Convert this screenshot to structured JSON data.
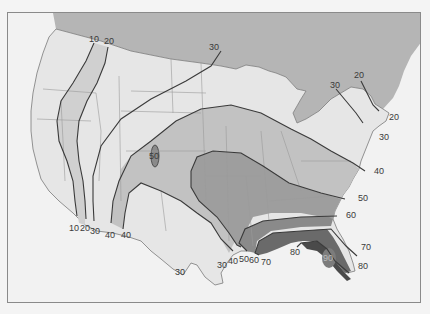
{
  "map": {
    "subject": "Isoline map of the contiguous United States",
    "colors": {
      "canada": "#b5b5b5",
      "ocean": "#f2f2f2",
      "land_base": "#e6e6e6",
      "band_10_20": "#d0d0d0",
      "band_20_30": "#dadada",
      "band_40_50": "#c2c2c2",
      "band_50_60": "#9e9e9e",
      "band_60_70": "#8a8a8a",
      "band_70_80": "#6a6a6a",
      "band_80_90": "#4a4a4a",
      "peak_90": "#7c7c7c",
      "isoline": "#3a3a3a",
      "state_border": "#9a9a9a",
      "frame": "#8a8a8a"
    },
    "isoline_labels": {
      "nw_10": "10",
      "nw_20": "20",
      "north_30": "30",
      "ne_20_top": "20",
      "ne_30_top": "30",
      "ne_20_coast": "20",
      "ne_30_coast": "30",
      "east_40": "40",
      "east_50": "50",
      "east_60": "60",
      "fl_70": "70",
      "fl_80": "80",
      "gulf_80": "80",
      "fl_peak_90": "90",
      "co_peak_50": "50",
      "sw_10": "10",
      "sw_20": "20",
      "sw_30": "30",
      "sw_40a": "40",
      "sw_40b": "40",
      "tx_30": "30",
      "gulf_30": "30",
      "gulf_40": "40",
      "gulf_50": "50",
      "gulf_60": "60",
      "gulf_70": "70"
    }
  }
}
